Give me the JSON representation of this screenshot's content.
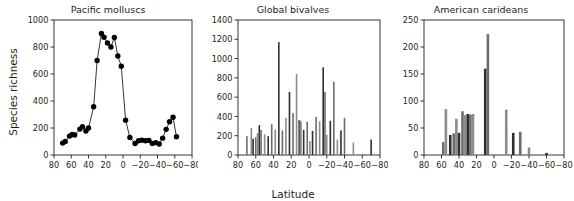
{
  "figure": {
    "ylabel": "Species richness",
    "xlabel": "Latitude",
    "panel_count": 3
  },
  "chart_data": [
    {
      "type": "line",
      "title": "Pacific molluscs",
      "xlabel": "",
      "ylabel": "Species richness",
      "xlim": [
        80,
        -80
      ],
      "ylim": [
        0,
        1000
      ],
      "xticks": [
        80,
        60,
        40,
        20,
        0,
        -20,
        -40,
        -60,
        -80
      ],
      "xticklabels": [
        "80",
        "60",
        "40",
        "20",
        "0",
        "−20",
        "−40",
        "−60",
        "−80"
      ],
      "yticks": [
        0,
        200,
        400,
        600,
        800,
        1000
      ],
      "yticklabels": [
        "0",
        "200",
        "400",
        "600",
        "800",
        "1000"
      ],
      "grid": false,
      "legend": "none",
      "marker": "filled-circle",
      "x": [
        70,
        67,
        62,
        59,
        56,
        50,
        47,
        43,
        40,
        34,
        30,
        25,
        22,
        18,
        14,
        10,
        6,
        2,
        -3,
        -8,
        -14,
        -18,
        -22,
        -26,
        -30,
        -34,
        -38,
        -42,
        -46,
        -50,
        -54,
        -58,
        -62
      ],
      "y": [
        88,
        100,
        140,
        152,
        148,
        192,
        210,
        178,
        200,
        357,
        700,
        900,
        872,
        830,
        800,
        870,
        733,
        658,
        258,
        130,
        85,
        105,
        110,
        106,
        108,
        86,
        92,
        82,
        125,
        190,
        246,
        280,
        135,
        197
      ],
      "values": [
        88,
        100,
        140,
        152,
        148,
        192,
        210,
        178,
        200,
        357,
        700,
        900,
        872,
        830,
        800,
        870,
        733,
        658,
        258,
        130,
        85,
        105,
        110,
        106,
        108,
        86,
        92,
        82,
        125,
        190,
        246,
        280,
        135,
        197
      ]
    },
    {
      "type": "bar",
      "title": "Global bivalves",
      "xlabel": "Latitude",
      "ylabel": "",
      "xlim": [
        80,
        -80
      ],
      "ylim": [
        0,
        1400
      ],
      "xticks": [
        80,
        60,
        40,
        20,
        0,
        -20,
        -40,
        -60,
        -80
      ],
      "xticklabels": [
        "80",
        "60",
        "40",
        "20",
        "0",
        "−20",
        "−40",
        "−60",
        "−80"
      ],
      "yticks": [
        0,
        200,
        400,
        600,
        800,
        1000,
        1200,
        1400
      ],
      "yticklabels": [
        "0",
        "200",
        "400",
        "600",
        "800",
        "1000",
        "1200",
        "1400"
      ],
      "grid": false,
      "legend": "none",
      "categories": [
        70,
        65,
        63,
        60,
        58,
        56,
        54,
        50,
        46,
        42,
        38,
        34,
        30,
        26,
        22,
        18,
        14,
        11,
        10,
        9,
        6,
        2,
        -1,
        -4,
        -8,
        -12,
        -16,
        -18,
        -20,
        -24,
        -28,
        -32,
        -36,
        -40,
        -50,
        -70
      ],
      "values": [
        195,
        280,
        170,
        185,
        225,
        310,
        260,
        215,
        195,
        320,
        265,
        1170,
        255,
        385,
        655,
        435,
        840,
        360,
        355,
        345,
        260,
        345,
        145,
        250,
        395,
        350,
        910,
        655,
        210,
        355,
        760,
        160,
        255,
        385,
        130,
        160
      ]
    },
    {
      "type": "bar",
      "title": "American carideans",
      "xlabel": "",
      "ylabel": "",
      "xlim": [
        80,
        -80
      ],
      "ylim": [
        0,
        250
      ],
      "xticks": [
        80,
        60,
        40,
        20,
        0,
        -20,
        -40,
        -60,
        -80
      ],
      "xticklabels": [
        "80",
        "60",
        "40",
        "20",
        "0",
        "−20",
        "−40",
        "−60",
        "−80"
      ],
      "yticks": [
        0,
        50,
        100,
        150,
        200,
        250
      ],
      "yticklabels": [
        "0",
        "50",
        "100",
        "150",
        "200",
        "250"
      ],
      "grid": false,
      "legend": "none",
      "categories": [
        58,
        55,
        50,
        46,
        43,
        40,
        36,
        33,
        30,
        27,
        24,
        10,
        7,
        -14,
        -22,
        -30,
        -40,
        -60
      ],
      "values": [
        24,
        85,
        37,
        40,
        67,
        41,
        81,
        74,
        76,
        75,
        76,
        160,
        224,
        84,
        41,
        43,
        14,
        4
      ]
    }
  ],
  "style": {
    "axis_color": "#231f20",
    "bar_color_dark": "#2f2f2f",
    "bar_color_mid": "#6d6d6d",
    "bar_color_light": "#8c8c8c",
    "marker_color": "#000000",
    "line_color": "#000000",
    "background": "#ffffff"
  }
}
